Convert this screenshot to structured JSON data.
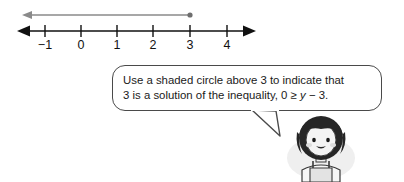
{
  "figure": {
    "type": "number-line-inequality-diagram",
    "background_color": "#ffffff"
  },
  "number_line": {
    "axis_color": "#111111",
    "ray_color": "#808080",
    "label_minus1": "−1",
    "label_0": "0",
    "label_1": "1",
    "label_2": "2",
    "label_3": "3",
    "label_4": "4",
    "ticks": [
      "−1",
      "0",
      "1",
      "2",
      "3",
      "4"
    ],
    "ray": {
      "endpoint_value": "3",
      "endpoint_style": "solid-dot",
      "direction": "left",
      "arrow": "left-arrowhead"
    },
    "axis_arrows": [
      "left",
      "right"
    ]
  },
  "callout": {
    "line1": "Use a shaded circle above 3 to indicate that",
    "line2_before": "3 is a solution of the inequality, 0 ≥ ",
    "line2_var": "y",
    "line2_after": " − 3.",
    "full_text": "Use a shaded circle above 3 to indicate that 3 is a solution of the inequality, 0 ≥ y − 3.",
    "border_color": "#4a4a4a",
    "fill_color": "#ffffff"
  },
  "character": {
    "name": "girl-student",
    "description": "cartoon girl with dark bob hair smiling wearing overalls",
    "hair_color": "#2b2b2b",
    "skin_color": "#f2f2f2"
  }
}
